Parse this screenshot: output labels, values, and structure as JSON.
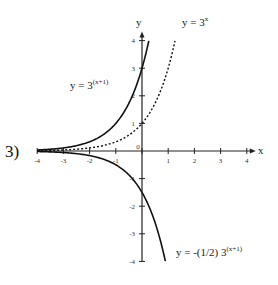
{
  "problem_number": "3)",
  "axes": {
    "x_label": "x",
    "y_label": "y",
    "x_ticks": [
      "-4",
      "-3",
      "-2",
      "-1",
      "0",
      "1",
      "2",
      "3",
      "4"
    ],
    "y_ticks": [
      "4",
      "3",
      "2",
      "1",
      "-1",
      "-2",
      "-3",
      "-4"
    ]
  },
  "labels": {
    "curve1_base": "y  =  3",
    "curve1_exp": "(x+1)",
    "curve2_base": "y  =  3",
    "curve2_exp": "x",
    "curve3_base": "y  =  -(1/2) 3",
    "curve3_exp": "(x+1)"
  },
  "chart_data": {
    "type": "line",
    "title": "",
    "xlabel": "x",
    "ylabel": "y",
    "xlim": [
      -4,
      4
    ],
    "ylim": [
      -4,
      4
    ],
    "grid": false,
    "x_ticks": [
      -4,
      -3,
      -2,
      -1,
      0,
      1,
      2,
      3,
      4
    ],
    "y_ticks": [
      -4,
      -3,
      -2,
      -1,
      0,
      1,
      2,
      3,
      4
    ],
    "series": [
      {
        "name": "y = 3^(x+1)",
        "style": "solid",
        "x": [
          -4,
          -3,
          -2,
          -1,
          0,
          0.26
        ],
        "y": [
          0.037,
          0.111,
          0.333,
          1,
          3,
          4
        ]
      },
      {
        "name": "y = 3^x",
        "style": "dotted",
        "x": [
          -4,
          -3,
          -2,
          -1,
          0,
          1,
          1.26
        ],
        "y": [
          0.012,
          0.037,
          0.111,
          0.333,
          1,
          3,
          4
        ]
      },
      {
        "name": "y = -(1/2) 3^(x+1)",
        "style": "solid",
        "x": [
          -4,
          -3,
          -2,
          -1,
          0,
          0.89
        ],
        "y": [
          -0.019,
          -0.056,
          -0.167,
          -0.5,
          -1.5,
          -4
        ]
      }
    ],
    "annotations": [
      "y = 3^(x+1)",
      "y = 3^x",
      "y = -(1/2) 3^(x+1)",
      "3)"
    ]
  }
}
